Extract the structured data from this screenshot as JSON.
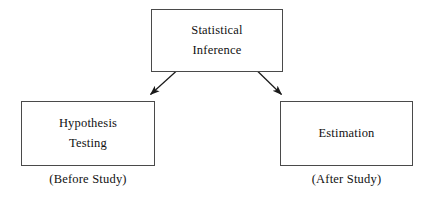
{
  "diagram": {
    "title_node": {
      "id": "statistical-inference",
      "lines": [
        "Statistical",
        "Inference"
      ]
    },
    "nodes": [
      {
        "id": "hypothesis-testing",
        "lines": [
          "Hypothesis",
          "Testing"
        ],
        "caption": "(Before Study)"
      },
      {
        "id": "estimation",
        "lines": [
          "Estimation"
        ],
        "caption": "(After Study)"
      }
    ],
    "edges": [
      {
        "id": "arrow-to-hypothesis-testing",
        "from": "statistical-inference",
        "to": "hypothesis-testing",
        "direction": "down-left"
      },
      {
        "id": "arrow-to-estimation",
        "from": "statistical-inference",
        "to": "estimation",
        "direction": "down-right"
      }
    ],
    "colors": {
      "border": "#4a4a4a",
      "text": "#111111",
      "arrow": "#1a1a1a",
      "background": "#ffffff"
    }
  }
}
